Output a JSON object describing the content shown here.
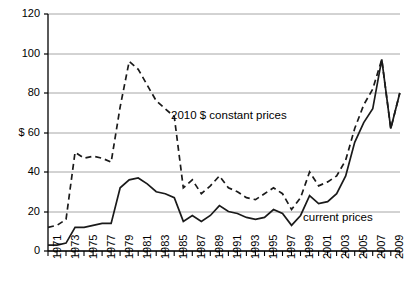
{
  "chart_data": {
    "type": "line",
    "title": "",
    "subtitle": "",
    "xlabel": "",
    "ylabel": "$",
    "ylim": [
      0,
      120
    ],
    "xlim": [
      1971,
      2010
    ],
    "yticks": [
      0,
      20,
      40,
      60,
      80,
      100,
      120
    ],
    "ytick_labels": [
      "0",
      "20",
      "40",
      "$ 60",
      "80",
      "100",
      "120"
    ],
    "grid": "horizontal",
    "legend_position": "inline-annotations",
    "x": [
      1971,
      1972,
      1973,
      1974,
      1975,
      1976,
      1977,
      1978,
      1979,
      1980,
      1981,
      1982,
      1983,
      1984,
      1985,
      1986,
      1987,
      1988,
      1989,
      1990,
      1991,
      1992,
      1993,
      1994,
      1995,
      1996,
      1997,
      1998,
      1999,
      2000,
      2001,
      2002,
      2003,
      2004,
      2005,
      2006,
      2007,
      2008,
      2009
    ],
    "xtick_labels": [
      "1971",
      "1973",
      "1975",
      "1977",
      "1979",
      "1981",
      "1983",
      "1985",
      "1987",
      "1989",
      "1991",
      "1993",
      "1995",
      "1997",
      "1999",
      "2001",
      "2003",
      "2005",
      "2007",
      "2009"
    ],
    "series": [
      {
        "name": "2010 $ constant prices",
        "style": "dashed",
        "color": "#1a1a1a",
        "label_x": 1986.2,
        "label_y": 66,
        "values": [
          12,
          13,
          16,
          50,
          47,
          48,
          47,
          45,
          73,
          96,
          92,
          84,
          76,
          72,
          68,
          32,
          36,
          29,
          33,
          38,
          32,
          30,
          27,
          26,
          29,
          32,
          29,
          21,
          27,
          40,
          33,
          35,
          38,
          46,
          62,
          74,
          82,
          97,
          62
        ]
      },
      {
        "name": "current prices",
        "style": "solid",
        "color": "#1a1a1a",
        "label_x": 2001.6,
        "label_y": 16,
        "values": [
          3,
          3,
          4,
          12,
          12,
          13,
          14,
          14,
          32,
          36,
          37,
          34,
          30,
          29,
          27,
          15,
          18,
          15,
          18,
          23,
          20,
          19,
          17,
          16,
          17,
          21,
          19,
          13,
          18,
          28,
          24,
          25,
          29,
          38,
          55,
          65,
          72,
          97,
          62
        ]
      }
    ],
    "tail_point": {
      "x": 2010,
      "y": 80,
      "note": "both series converge to ~80 at right edge"
    }
  },
  "axis": {
    "y_axis_line_color": "#000000",
    "grid_color": "#a6a6a6",
    "tick_color": "#000000"
  }
}
